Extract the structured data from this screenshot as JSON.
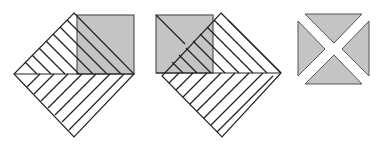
{
  "diagram": {
    "colors": {
      "fill": "#c4c4c4",
      "stroke": "#222222",
      "background": "#ffffff"
    },
    "figures": [
      {
        "name": "figure-1",
        "type": "hatched-diamond-with-square-right"
      },
      {
        "name": "figure-2",
        "type": "hatched-diamond-with-square-left"
      },
      {
        "name": "figure-3",
        "type": "square-split-into-four-triangles"
      }
    ]
  }
}
